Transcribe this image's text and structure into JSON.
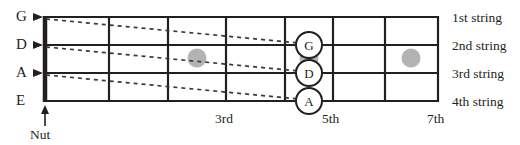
{
  "diagram": {
    "type": "bass-guitar-fretboard",
    "colors": {
      "ink": "#231f20",
      "fret": "#231f20",
      "string_dotted": "#3a3a3a",
      "inlay_dot": "#b3b3b3",
      "background": "#ffffff"
    },
    "open_string_labels": [
      {
        "label": "G",
        "string_index": 1
      },
      {
        "label": "D",
        "string_index": 2
      },
      {
        "label": "A",
        "string_index": 3
      },
      {
        "label": "E",
        "string_index": 4
      }
    ],
    "string_name_labels": [
      {
        "label": "1st string"
      },
      {
        "label": "2nd string"
      },
      {
        "label": "3rd string"
      },
      {
        "label": "4th string"
      }
    ],
    "fret_number_labels": [
      {
        "label": "3rd",
        "fret": 3
      },
      {
        "label": "5th",
        "fret": 5
      },
      {
        "label": "7th",
        "fret": 7
      }
    ],
    "nut": {
      "label": "Nut"
    },
    "marked_notes": [
      {
        "label": "G",
        "string": "1st string",
        "fret": 5
      },
      {
        "label": "D",
        "string": "2nd string",
        "fret": 5
      },
      {
        "label": "A",
        "string": "3rd string",
        "fret": 5
      }
    ],
    "inlay_dots": [
      {
        "fret": 3
      },
      {
        "fret": 5
      },
      {
        "fret": 7
      }
    ]
  }
}
